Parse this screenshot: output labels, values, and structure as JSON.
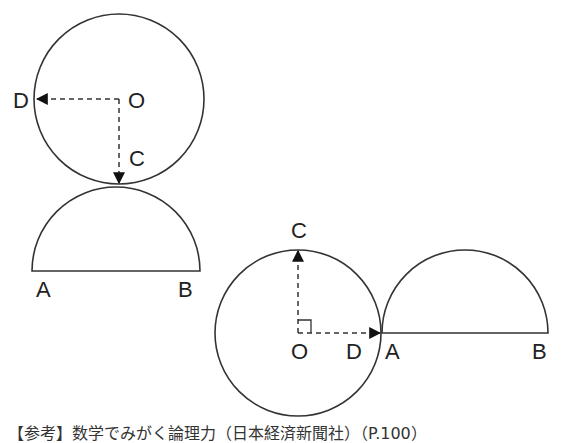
{
  "figure1": {
    "labels": {
      "D": "D",
      "O": "O",
      "C": "C",
      "A": "A",
      "B": "B"
    },
    "circle": {
      "cx": 119,
      "cy": 99,
      "r": 85
    },
    "semicircle": {
      "cx": 116,
      "cy": 271,
      "r": 84
    }
  },
  "figure2": {
    "labels": {
      "C": "C",
      "O": "O",
      "D": "D",
      "A": "A",
      "B": "B"
    },
    "circle": {
      "cx": 298,
      "cy": 333,
      "r": 83
    },
    "semicircle": {
      "cx": 465,
      "cy": 333,
      "r": 83
    }
  },
  "caption": "【参考】数学でみがく論理力（日本経済新聞社）（P.100）",
  "colors": {
    "stroke": "#333333",
    "text": "#222222"
  }
}
